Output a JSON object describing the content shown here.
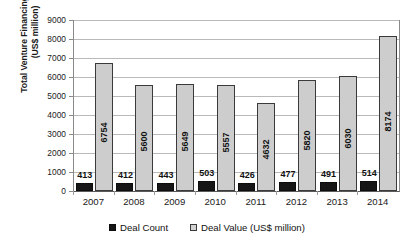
{
  "chart_data": {
    "type": "bar",
    "title": "",
    "xlabel": "",
    "ylabel": "Total Venture Financing Value (US$ million)",
    "ylabel_line1": "Total Venture Financing Value",
    "ylabel_line2": "(US$ million)",
    "categories": [
      "2007",
      "2008",
      "2009",
      "2010",
      "2011",
      "2012",
      "2013",
      "2014"
    ],
    "ylim": [
      0,
      9000
    ],
    "ytick_labels": [
      "0",
      "1000",
      "2000",
      "3000",
      "4000",
      "5000",
      "6000",
      "7000",
      "8000",
      "9000"
    ],
    "ytick_values": [
      0,
      1000,
      2000,
      3000,
      4000,
      5000,
      6000,
      7000,
      8000,
      9000
    ],
    "grid": "horizontal",
    "legend_position": "bottom-center",
    "series": [
      {
        "name": "Deal Count",
        "color": "#161616",
        "values": [
          413,
          412,
          443,
          503,
          426,
          477,
          491,
          514
        ],
        "labels": [
          "413",
          "412",
          "443",
          "503",
          "426",
          "477",
          "491",
          "514"
        ]
      },
      {
        "name": "Deal Value (US$ million)",
        "color": "#cdcdcd",
        "values": [
          6754,
          5600,
          5649,
          5557,
          4632,
          5820,
          6030,
          8174
        ],
        "labels": [
          "6754",
          "5600",
          "5649",
          "5557",
          "4632",
          "5820",
          "6030",
          "8174"
        ]
      }
    ]
  },
  "legend": {
    "items": [
      {
        "label": "Deal Count",
        "swatch": "black-square-marker"
      },
      {
        "label": "Deal Value (US$ million)",
        "swatch": "gray-square-marker"
      }
    ]
  }
}
